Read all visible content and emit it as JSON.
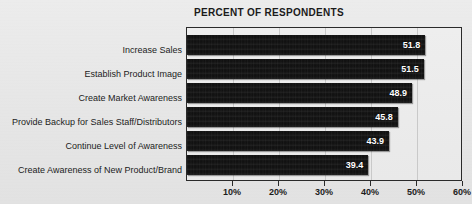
{
  "chart_data": {
    "type": "bar",
    "orientation": "horizontal",
    "title": "PERCENT OF RESPONDENTS",
    "xlabel": "",
    "ylabel": "",
    "categories": [
      "Increase Sales",
      "Establish Product Image",
      "Create Market Awareness",
      "Provide Backup for Sales Staff/Distributors",
      "Continue Level of Awareness",
      "Create Awareness of New Product/Brand"
    ],
    "values": [
      51.8,
      51.5,
      48.9,
      45.8,
      43.9,
      39.4
    ],
    "value_labels": [
      "51.8",
      "51.5",
      "48.9",
      "45.8",
      "43.9",
      "39.4"
    ],
    "xlim": [
      0,
      60
    ],
    "xticks": [
      10,
      20,
      30,
      40,
      50,
      60
    ],
    "xtick_labels": [
      "10%",
      "20%",
      "30%",
      "40%",
      "50%",
      "60%"
    ],
    "grid": true,
    "grid_axis": "x",
    "legend": false,
    "bar_color": "#121212",
    "value_label_color": "#ffffff",
    "plot_background": "#ebebeb",
    "figure_background": "#e9e9e9",
    "axis_color": "#2a2a2a",
    "grid_color": "#c9c9c9"
  }
}
